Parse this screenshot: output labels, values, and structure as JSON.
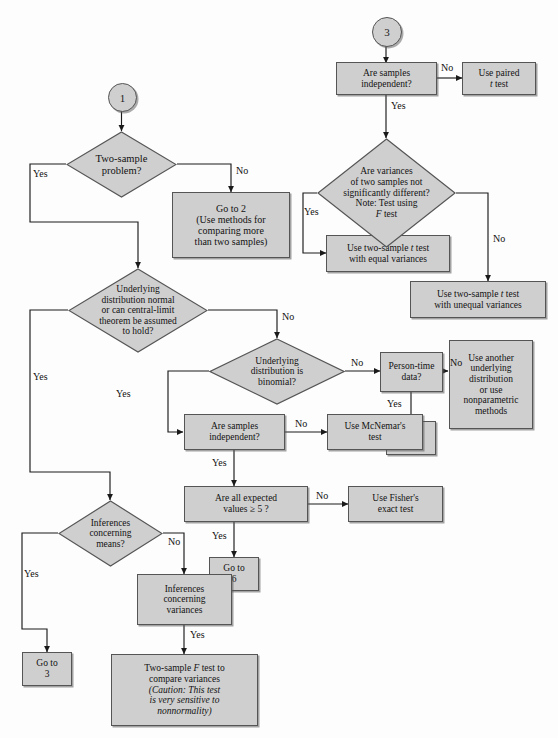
{
  "diagram": {
    "type": "decision-flowchart",
    "colors": {
      "node_fill": "#cfcfcf",
      "node_border": "#555555",
      "line": "#1a1a1a",
      "background": "#fdfdfd",
      "text": "#121212"
    }
  },
  "connectors": {
    "yes": "Yes",
    "no": "No"
  },
  "nodes": {
    "start_1": {
      "label": "1",
      "shape": "circle"
    },
    "start_3": {
      "label": "3",
      "shape": "circle"
    },
    "two_sample_problem": {
      "shape": "diamond",
      "lines": [
        "Two-sample",
        "problem?"
      ]
    },
    "go_to_2": {
      "shape": "box",
      "lines": [
        "Go to 2",
        "(Use methods for",
        "comparing more",
        "than two samples)"
      ]
    },
    "underlying_normal": {
      "shape": "diamond",
      "lines": [
        "Underlying",
        "distribution normal",
        "or can central-limit",
        "theorem be assumed",
        "to hold?"
      ]
    },
    "underlying_binomial": {
      "shape": "diamond",
      "lines": [
        "Underlying",
        "distribution is",
        "binomial?"
      ]
    },
    "person_time_data": {
      "shape": "box",
      "lines": [
        "Person-time",
        "data?"
      ]
    },
    "use_another_distribution": {
      "shape": "box",
      "lines": [
        "Use another",
        "underlying",
        "distribution",
        "or use",
        "nonparametric",
        "methods"
      ]
    },
    "go_to_5": {
      "shape": "box",
      "lines": [
        "Go to",
        "5"
      ]
    },
    "are_samples_independent_mid": {
      "shape": "box",
      "lines": [
        "Are samples",
        "independent?"
      ]
    },
    "use_mcnemar": {
      "shape": "box",
      "lines": [
        "Use McNemar's",
        "test"
      ]
    },
    "all_expected_values": {
      "shape": "box",
      "lines": [
        "Are all expected",
        "values ≥ 5 ?"
      ]
    },
    "use_fisher": {
      "shape": "box",
      "lines": [
        "Use Fisher's",
        "exact test"
      ]
    },
    "go_to_6": {
      "shape": "box",
      "lines": [
        "Go to",
        "6"
      ]
    },
    "inferences_means": {
      "shape": "diamond",
      "lines": [
        "Inferences",
        "concerning",
        "means?"
      ]
    },
    "go_to_3": {
      "shape": "box",
      "lines": [
        "Go to",
        "3"
      ]
    },
    "inferences_variances": {
      "shape": "box",
      "lines": [
        "Inferences",
        "concerning",
        "variances"
      ]
    },
    "two_sample_f_test": {
      "shape": "box",
      "line1_pre": "Two-sample ",
      "line1_ital": "F",
      "line1_post": " test to",
      "line2": "compare variances",
      "line3": "(Caution: This test",
      "line4": "is very sensitive to",
      "line5": "nonnormality)"
    },
    "are_samples_independent_top": {
      "shape": "box",
      "lines": [
        "Are samples",
        "independent?"
      ]
    },
    "use_paired_t": {
      "shape": "box",
      "line1": "Use paired",
      "line2_ital": "t",
      "line2_post": " test"
    },
    "are_variances_not_different": {
      "shape": "diamond",
      "line1": "Are variances",
      "line2": "of two samples not",
      "line3": "significantly different?",
      "line4": "Note: Test using",
      "line5_ital": "F",
      "line5_post": " test"
    },
    "two_sample_equal_var": {
      "shape": "box",
      "line1_pre": "Use two-sample ",
      "line1_ital": "t",
      "line1_post": " test",
      "line2": "with equal variances"
    },
    "two_sample_unequal_var": {
      "shape": "box",
      "line1_pre": "Use two-sample ",
      "line1_ital": "t",
      "line1_post": " test",
      "line2": "with unequal variances"
    }
  },
  "edge_labels": {
    "tsp_no": "No",
    "tsp_yes": "Yes",
    "normal_no": "No",
    "normal_yes": "Yes",
    "binomial_no": "No",
    "binomial_yes": "Yes",
    "person_no": "No",
    "person_yes": "Yes",
    "indep_mid_no": "No",
    "indep_mid_yes": "Yes",
    "expected_no": "No",
    "expected_yes": "Yes",
    "means_yes": "Yes",
    "means_no": "No",
    "variances_yes": "Yes",
    "indep_top_no": "No",
    "indep_top_yes": "Yes",
    "var_diff_yes": "Yes",
    "var_diff_no": "No"
  }
}
